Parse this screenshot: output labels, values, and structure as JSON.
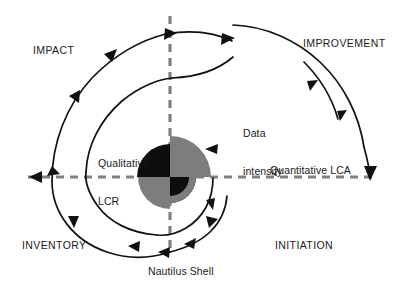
{
  "figure": {
    "title": "Nautilus Shell",
    "caption": "Nautilus Shell",
    "width": 399,
    "height": 294,
    "background_color": "#ffffff"
  },
  "diagram": {
    "type": "spiral-cycle-diagram",
    "center": {
      "x": 170,
      "y": 177
    },
    "quadrant_labels": [
      {
        "name": "impact",
        "text": "IMPACT",
        "quadrant": "upper-left"
      },
      {
        "name": "improvement",
        "text": "IMPROVEMENT",
        "quadrant": "upper-right"
      },
      {
        "name": "inventory",
        "text": "INVENTORY",
        "quadrant": "lower-left"
      },
      {
        "name": "initiation",
        "text": "INITIATION",
        "quadrant": "lower-right"
      }
    ],
    "annotations": [
      {
        "name": "data-intensity",
        "text": "Data\nintensity",
        "line1": "Data",
        "line2": "intensity"
      },
      {
        "name": "qualitative-lcr",
        "text": "Qualitative\nLCR",
        "line1": "Qualitative",
        "line2": "LCR"
      },
      {
        "name": "quantitative-lca",
        "text": "Quantitative LCA"
      }
    ],
    "axes": {
      "horizontal": {
        "name": "quantitative-axis",
        "label": "Quantitative LCA",
        "style": "dashed",
        "color": "#808080",
        "arrow_left": true,
        "arrow_right_down": true
      },
      "vertical": {
        "name": "qualitative-axis",
        "style": "dashed",
        "color": "#808080"
      }
    },
    "shell": {
      "name": "nautilus-shell-core",
      "quadrant_colors": {
        "upper_left": "#000000",
        "upper_right": "#808080",
        "lower_left": "#808080",
        "lower_right": "#000000"
      }
    },
    "spiral": {
      "name": "logarithmic-spiral",
      "direction": "counterclockwise",
      "stroke_color": "#000000",
      "arrowhead_count": 14
    }
  }
}
